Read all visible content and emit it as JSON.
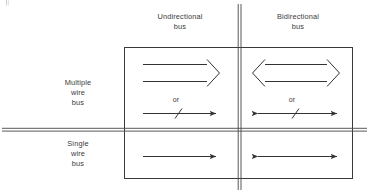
{
  "figure": {
    "background_color": "#ffffff",
    "line_color": "#333333",
    "columns": [
      {
        "id": "unidirectional",
        "heading": "Undirectional\nbus"
      },
      {
        "id": "bidirectional",
        "heading": "Bidirectional\nbus"
      }
    ],
    "rows": [
      {
        "id": "multiple-wire",
        "heading": "Multiple\nwire\nbus"
      },
      {
        "id": "single-wire",
        "heading": "Single\nwire\nbus"
      }
    ],
    "alternative_label": "or",
    "cells": [
      {
        "row": "multiple-wire",
        "column": "unidirectional",
        "symbols": [
          {
            "name": "hollow-arrow-right",
            "style": "outline",
            "heads": "right"
          },
          {
            "name": "slashed-arrow-right",
            "style": "single-line-with-slash",
            "heads": "right"
          }
        ],
        "separator_label": "or"
      },
      {
        "row": "multiple-wire",
        "column": "bidirectional",
        "symbols": [
          {
            "name": "hollow-arrow-double",
            "style": "outline",
            "heads": "both"
          },
          {
            "name": "slashed-arrow-double",
            "style": "single-line-with-slash",
            "heads": "both"
          }
        ],
        "separator_label": "or"
      },
      {
        "row": "single-wire",
        "column": "unidirectional",
        "symbols": [
          {
            "name": "plain-arrow-right",
            "style": "single-line",
            "heads": "right"
          }
        ],
        "separator_label": ""
      },
      {
        "row": "single-wire",
        "column": "bidirectional",
        "symbols": [
          {
            "name": "plain-arrow-double",
            "style": "single-line",
            "heads": "both"
          }
        ],
        "separator_label": ""
      }
    ]
  }
}
